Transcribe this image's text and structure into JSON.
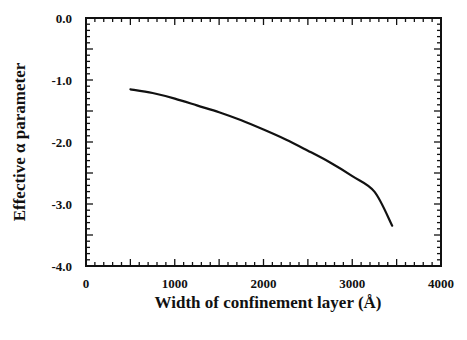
{
  "chart_data": {
    "type": "line",
    "title": "",
    "xlabel": "Width of confinement layer (Å)",
    "ylabel": "Effective α parameter",
    "xlim": [
      0,
      4000
    ],
    "ylim": [
      -4.0,
      0.0
    ],
    "x_ticks": [
      "0",
      "1000",
      "2000",
      "3000",
      "4000"
    ],
    "y_ticks": [
      "0.0",
      "-1.0",
      "-2.0",
      "-3.0",
      "-4.0"
    ],
    "grid": false,
    "legend": null,
    "series": [
      {
        "name": "Effective α parameter",
        "x": [
          500,
          750,
          1000,
          1250,
          1500,
          1750,
          2000,
          2250,
          2500,
          2750,
          3000,
          3250,
          3450
        ],
        "y": [
          -1.15,
          -1.21,
          -1.3,
          -1.41,
          -1.52,
          -1.65,
          -1.8,
          -1.96,
          -2.14,
          -2.33,
          -2.55,
          -2.8,
          -3.35
        ]
      }
    ]
  }
}
